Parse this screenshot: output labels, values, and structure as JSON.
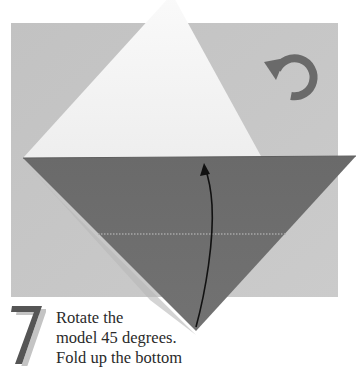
{
  "figure": {
    "type": "origami-instruction-step",
    "colors": {
      "background": "#c4c4c4",
      "paper_white": "#f4f4f4",
      "paper_dark": "#6e6e6e",
      "arrow": "#111111",
      "rotate_icon": "#6a6a6a",
      "fold_line": "#a8a8a8",
      "step_number": "#555555",
      "step_number_shadow": "#bfbfbf"
    },
    "icons": {
      "rotate": "rotate-counterclockwise-icon",
      "fold_arrow": "fold-up-arrow-icon"
    }
  },
  "step": {
    "number": "7",
    "lines": [
      "Rotate the",
      "model 45 degrees.",
      "Fold up the bottom"
    ]
  }
}
